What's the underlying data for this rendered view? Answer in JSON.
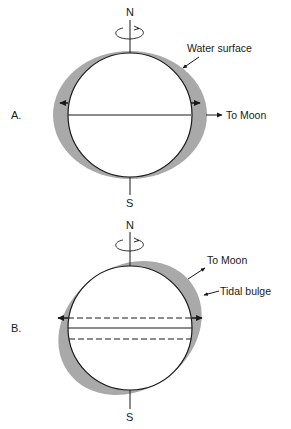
{
  "colors": {
    "bulge": "#a9a9a9",
    "line": "#1a1a1a",
    "earth": "#ffffff"
  },
  "panel_a": {
    "label": "A.",
    "north": "N",
    "south": "S",
    "water_label": "Water surface",
    "moon_label": "To Moon"
  },
  "panel_b": {
    "label": "B.",
    "north": "N",
    "south": "S",
    "moon_label": "To Moon",
    "bulge_label": "Tidal bulge"
  }
}
